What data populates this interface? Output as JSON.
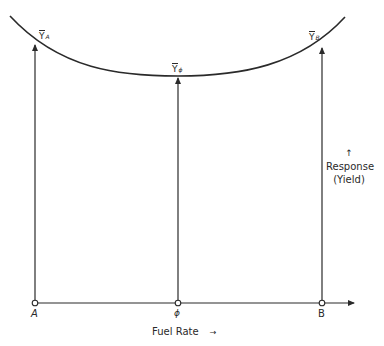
{
  "diagram": {
    "curve_label": "Response curve",
    "points": [
      {
        "id": "A",
        "label": "A",
        "response_label": "Y",
        "response_subscript": "A"
      },
      {
        "id": "phi",
        "label": "ϕ",
        "response_label": "Y",
        "response_subscript": "ϕ"
      },
      {
        "id": "B",
        "label": "B",
        "response_label": "Y",
        "response_subscript": "B"
      }
    ],
    "x_axis": {
      "label": "Fuel Rate",
      "arrow": "→"
    },
    "y_axis": {
      "arrow": "↑",
      "label_line1": "Response",
      "label_line2": "(Yield)"
    },
    "colors": {
      "ink": "#2a2a2a",
      "background": "#ffffff"
    }
  }
}
